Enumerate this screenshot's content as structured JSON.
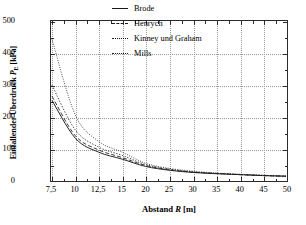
{
  "chart_data": {
    "type": "line",
    "title": "",
    "xlabel": "Abstand R [m]",
    "xlabel_parts": {
      "pre": "Abstand ",
      "italic": "R",
      "post": " [m]"
    },
    "ylabel": "Einfallender Überdruck P_E [kPa]",
    "ylabel_parts": {
      "pre": "Einfallender Überdruck ",
      "italic": "P",
      "sub": "E",
      "post": " [kPa]"
    },
    "x": [
      7.5,
      10,
      12.5,
      15,
      20,
      25,
      30,
      35,
      40,
      45,
      50
    ],
    "x_tick_labels": [
      "7,5",
      "10",
      "12,5",
      "15",
      "20",
      "25",
      "30",
      "35",
      "40",
      "45",
      "50"
    ],
    "y_tick_labels": [
      "0",
      "100",
      "200",
      "300",
      "400",
      "500"
    ],
    "y_ticks": [
      0,
      100,
      200,
      300,
      400,
      500
    ],
    "ylim": [
      0,
      500
    ],
    "xlim_index": [
      0,
      10
    ],
    "grid": true,
    "grid_style": "dotted",
    "legend_position": "top-center",
    "axis_note": "x positions are evenly spaced per tick (ordinal spacing)",
    "series": [
      {
        "name": "Brode",
        "style": "solid",
        "values": [
          252,
          132,
          88,
          66,
          43,
          31,
          24,
          20,
          17,
          14,
          12
        ]
      },
      {
        "name": "Henrych",
        "style": "dashed",
        "values": [
          265,
          140,
          95,
          71,
          46,
          33,
          25,
          21,
          17,
          14,
          12
        ]
      },
      {
        "name": "Kinney und Graham",
        "style": "dash-dot",
        "values": [
          300,
          158,
          104,
          78,
          49,
          35,
          26,
          21,
          18,
          15,
          12
        ]
      },
      {
        "name": "Mills",
        "style": "dotted",
        "values": [
          445,
          205,
          122,
          88,
          53,
          37,
          28,
          22,
          18,
          15,
          12
        ]
      }
    ]
  },
  "legend": {
    "items": [
      {
        "label": "Brode",
        "style": "solid"
      },
      {
        "label": "Henrych",
        "style": "dashed"
      },
      {
        "label": "Kinney und Graham",
        "style": "dash-dot"
      },
      {
        "label": "Mills",
        "style": "dotted"
      }
    ]
  },
  "colors": {
    "axis": "#2b2b2b",
    "grid": "#9a9a9a",
    "line": "#1a1a1a",
    "background": "#ffffff"
  }
}
